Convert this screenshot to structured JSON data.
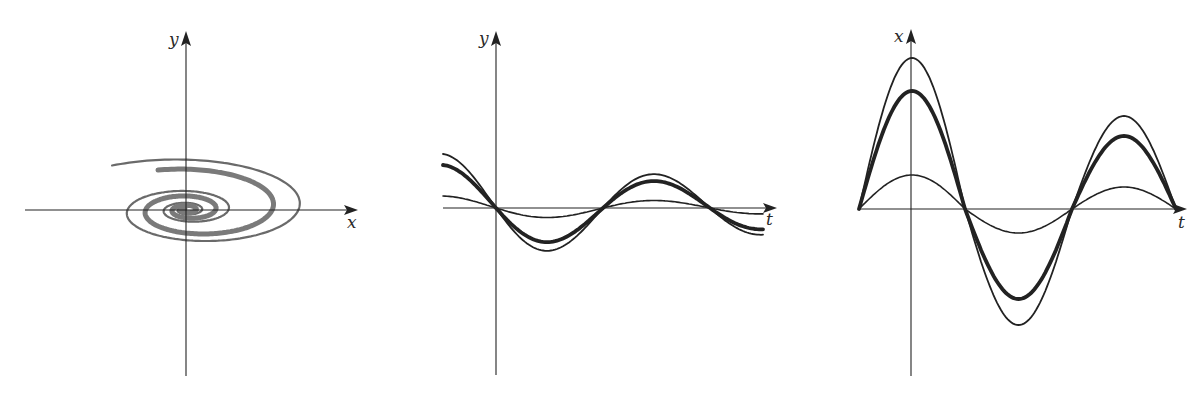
{
  "figure": {
    "panels": [
      {
        "id": "phase-portrait",
        "kind": "phase-plane spiral",
        "x_axis_label": "x",
        "y_axis_label": "y",
        "origin": [
          186,
          210
        ],
        "x_axis": [
          25,
          358
        ],
        "y_axis": [
          32,
          376
        ],
        "curves": [
          {
            "name": "thin-spiral",
            "style": "thin",
            "color": "#6a6a6a",
            "width": 2.2,
            "a_start": 146,
            "b_start": 55,
            "theta_start": 2.2,
            "turns": 3.1,
            "decay": 0.155
          },
          {
            "name": "thick-spiral",
            "style": "thick",
            "color": "#7a7a7a",
            "width": 5,
            "a_start": 108,
            "b_start": 43,
            "theta_start": 1.95,
            "turns": 3.0,
            "decay": 0.17
          }
        ]
      },
      {
        "id": "y-vs-t",
        "kind": "time series",
        "x_axis_label": "t",
        "y_axis_label": "y",
        "origin": [
          496,
          208
        ],
        "x_axis": [
          443,
          776
        ],
        "y_axis": [
          32,
          376
        ],
        "curves": [
          {
            "name": "outer-thin",
            "style": "thin",
            "amp0": 54,
            "width": 1.8
          },
          {
            "name": "middle-thick",
            "style": "thick",
            "amp0": 43,
            "width": 3.8
          },
          {
            "name": "inner-thin",
            "style": "thin",
            "amp0": 12,
            "width": 1.6
          }
        ],
        "t_start": 443,
        "t_end": 763,
        "half_period": 107,
        "decay": 0.0022
      },
      {
        "id": "x-vs-t",
        "kind": "time series",
        "x_axis_label": "t",
        "y_axis_label": "x",
        "origin": [
          911,
          209
        ],
        "x_axis": [
          859,
          1186
        ],
        "y_axis": [
          30,
          376
        ],
        "curves": [
          {
            "name": "outer-thin",
            "style": "thin",
            "peaks": [
              151,
              -116,
              93
            ],
            "width": 1.8
          },
          {
            "name": "middle-thick",
            "style": "thick",
            "peaks": [
              118,
              -90,
              73
            ],
            "width": 3.8
          },
          {
            "name": "inner-thin",
            "style": "thin",
            "peaks": [
              34,
              -24,
              22
            ],
            "width": 1.6
          }
        ],
        "zeros": [
          859,
          965,
          1072,
          1176
        ],
        "peak_x": [
          911,
          1017,
          1122
        ]
      }
    ]
  },
  "chart_data": [
    {
      "type": "line",
      "title": "",
      "xlabel": "x",
      "ylabel": "y",
      "description": "Phase-plane trajectories: two interleaved elliptical spirals (one thin, one thick) winding inward toward the origin",
      "series": [
        {
          "name": "thin spiral",
          "x_extent": [
            -146,
            146
          ],
          "y_extent": [
            -58,
            55
          ]
        },
        {
          "name": "thick spiral",
          "x_extent": [
            -88,
            108
          ],
          "y_extent": [
            -43,
            43
          ]
        }
      ],
      "grid": false,
      "legend": "none"
    },
    {
      "type": "line",
      "title": "",
      "xlabel": "t",
      "ylabel": "y",
      "description": "Three damped oscillations all passing through the origin with common zero crossings",
      "x": [
        -1.0,
        0,
        1.0,
        2.0,
        3.0,
        4.0,
        5.0
      ],
      "series": [
        {
          "name": "outer thin",
          "values": [
            54,
            0,
            -41,
            0,
            34,
            0,
            -24
          ]
        },
        {
          "name": "thick",
          "values": [
            43,
            0,
            -32,
            0,
            27,
            0,
            -19
          ]
        },
        {
          "name": "inner thin",
          "values": [
            12,
            0,
            -8,
            0,
            8,
            0,
            -5
          ]
        }
      ],
      "zero_crossings": [
        0,
        2,
        4
      ],
      "grid": false,
      "legend": "none"
    },
    {
      "type": "line",
      "title": "",
      "xlabel": "t",
      "ylabel": "x",
      "description": "Three oscillations with shared zero crossings; amplitudes scale, largest peak at t=0",
      "x": [
        -1,
        0,
        1,
        2,
        3,
        4,
        5
      ],
      "series": [
        {
          "name": "outer thin",
          "values": [
            0,
            151,
            0,
            -116,
            0,
            93,
            0
          ]
        },
        {
          "name": "thick",
          "values": [
            0,
            118,
            0,
            -90,
            0,
            73,
            0
          ]
        },
        {
          "name": "inner thin",
          "values": [
            0,
            34,
            0,
            -24,
            0,
            22,
            0
          ]
        }
      ],
      "grid": false,
      "legend": "none"
    }
  ]
}
